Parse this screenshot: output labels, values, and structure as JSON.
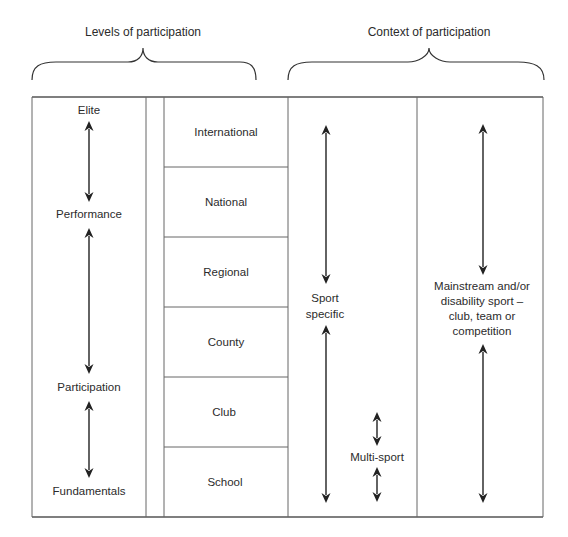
{
  "headers": {
    "levels": "Levels of participation",
    "context": "Context of participation"
  },
  "participation_stages": [
    "Elite",
    "Performance",
    "Participation",
    "Fundamentals"
  ],
  "levels": [
    "International",
    "National",
    "Regional",
    "County",
    "Club",
    "School"
  ],
  "sport_context": {
    "sport_specific": [
      "Sport",
      "specific"
    ],
    "multi_sport": "Multi-sport"
  },
  "mainstream_context": [
    "Mainstream and/or",
    "disability sport –",
    "club, team or",
    "competition"
  ]
}
